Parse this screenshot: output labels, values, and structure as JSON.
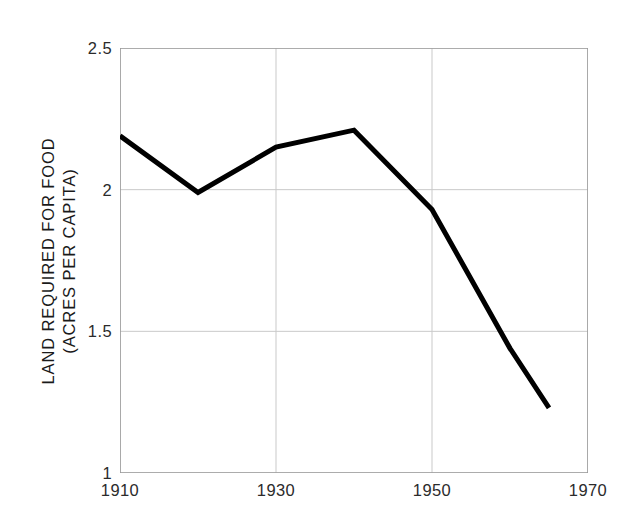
{
  "chart_data": {
    "type": "line",
    "title": "",
    "xlabel": "",
    "ylabel": "LAND REQUIRED FOR FOOD (ACRES PER CAPITA)",
    "ylabel_line1": "LAND REQUIRED FOR FOOD",
    "ylabel_line2": "(ACRES PER CAPITA)",
    "xlim": [
      1910,
      1970
    ],
    "ylim": [
      1,
      2.5
    ],
    "xticks": [
      1910,
      1930,
      1950,
      1970
    ],
    "xtick_labels": [
      "1910",
      "1930",
      "1950",
      "1970"
    ],
    "yticks": [
      1,
      1.5,
      2,
      2.5
    ],
    "ytick_labels": [
      "1",
      "1.5",
      "2",
      "2.5"
    ],
    "grid": true,
    "grid_color": "#c9c9c9",
    "legend": null,
    "line_color": "#000000",
    "line_width": 5,
    "x": [
      1910,
      1920,
      1930,
      1940,
      1950,
      1960,
      1965
    ],
    "values": [
      2.19,
      1.99,
      2.15,
      2.21,
      1.93,
      1.44,
      1.23
    ],
    "series": [
      {
        "name": "Land required for food",
        "points": [
          {
            "x": 1910,
            "y": 2.19
          },
          {
            "x": 1920,
            "y": 1.99
          },
          {
            "x": 1930,
            "y": 2.15
          },
          {
            "x": 1940,
            "y": 2.21
          },
          {
            "x": 1950,
            "y": 1.93
          },
          {
            "x": 1960,
            "y": 1.44
          },
          {
            "x": 1965,
            "y": 1.23
          }
        ]
      }
    ]
  }
}
